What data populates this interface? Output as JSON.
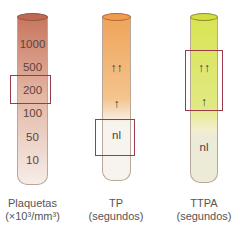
{
  "tubes": [
    {
      "name": "Plaquetas",
      "caption_line1": "Plaquetas",
      "caption_line2": "(×10³/mm³)",
      "scale": [
        "1000",
        "500",
        "200",
        "100",
        "50",
        "10"
      ],
      "highlighted": "200",
      "color_top": "#c8765e",
      "color_bottom": "#f6ede8"
    },
    {
      "name": "TP",
      "caption_line1": "TP",
      "caption_line2": "(segundos)",
      "markers": [
        "↑↑",
        "↑",
        "nl"
      ],
      "highlighted": "nl",
      "color_top": "#efa45a",
      "color_bottom": "#f7f3ee"
    },
    {
      "name": "TTPA",
      "caption_line1": "TTPA",
      "caption_line2": "(segundos)",
      "markers": [
        "↑↑",
        "↑",
        "nl"
      ],
      "highlighted": "↑↑ ↑",
      "color_top": "#d9e453",
      "color_bottom": "#ecebd8"
    }
  ],
  "colors": {
    "highlight_box": "#9b3b4a"
  }
}
